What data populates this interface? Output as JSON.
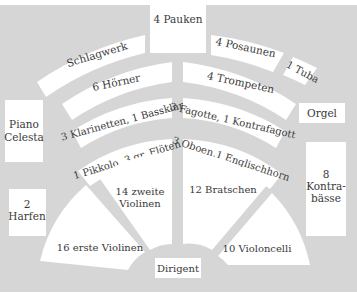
{
  "colors": {
    "panel": "#d6d6d6",
    "block": "#ffffff",
    "text": "#3a3a3a"
  },
  "diagram": {
    "top_center": "4 Pauken",
    "arcs": {
      "left": [
        "Schlagwerk",
        "6 Hörner",
        "3 Klarinetten, 1 Bassklar.",
        "1 Pikkolo, 3 gr. Flöten"
      ],
      "right": [
        "4 Posaunen",
        "4 Trompeten",
        "3 Fagotte, 1 Kontrafagott",
        "3 Oboen,1 Englischhorn"
      ],
      "tuba": "1 Tuba"
    },
    "side_boxes": {
      "piano_line1": "Piano",
      "piano_line2": "Celesta",
      "harfen_line1": "2",
      "harfen_line2": "Harfen",
      "orgel": "Orgel",
      "kontrabaesse_line1": "8",
      "kontrabaesse_line2": "Kontra-",
      "kontrabaesse_line3": "bässe"
    },
    "strings": {
      "erste_violinen": "16 erste Violinen",
      "zweite_violinen_line1": "14 zweite",
      "zweite_violinen_line2": "Violinen",
      "bratschen": "12 Bratschen",
      "violoncelli": "10 Violoncelli"
    },
    "conductor": "Dirigent"
  }
}
